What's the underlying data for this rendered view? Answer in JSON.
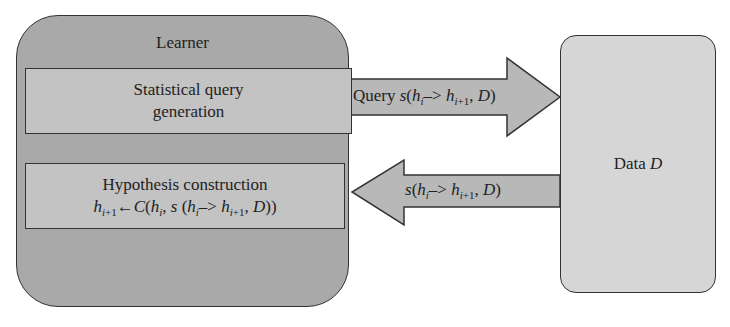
{
  "learner": {
    "title": "Learner",
    "query_box": {
      "line1": "Statistical query",
      "line2": "generation"
    },
    "hypothesis_box": {
      "line1": "Hypothesis construction",
      "formula": "h_{i+1} ← C(h_i, s (h_i –> h_{i+1}, D))"
    }
  },
  "data_box": {
    "label": "Data",
    "var": "D"
  },
  "arrows": {
    "query": {
      "direction": "right",
      "prefix": "Query",
      "text": "s(h_i –> h_{i+1}, D)"
    },
    "response": {
      "direction": "left",
      "text": "s(h_i –> h_{i+1}, D)"
    }
  },
  "colors": {
    "learner_fill": "#a9a9a9",
    "inner_fill": "#c3c3c3",
    "data_fill": "#d6d6d6",
    "arrow_fill": "#b8b8b8",
    "stroke": "#333333"
  }
}
